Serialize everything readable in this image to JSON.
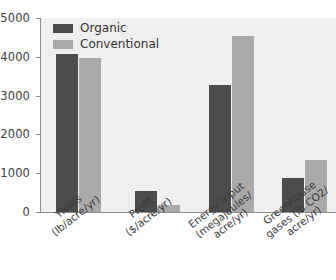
{
  "chart_data": {
    "type": "bar",
    "title": "",
    "subtitle": "",
    "xlabel": "",
    "ylabel": "",
    "ylim": [
      0,
      5000
    ],
    "yticks": [
      0,
      1000,
      2000,
      3000,
      4000,
      5000
    ],
    "ytick_labels": [
      "0",
      "1000",
      "2000",
      "3000",
      "4000",
      "5000"
    ],
    "grid": false,
    "legend_position": "top-left",
    "categories": [
      "Yields (lb/acre/yr)",
      "Profit ($/acre/yr)",
      "Energy input (megajoules/acre/yr)",
      "Greenhouse gases (lb CO2/acre/yr)"
    ],
    "category_lines": [
      [
        "Yields",
        "(lb/acre/yr)"
      ],
      [
        "Profit",
        "($/acre/yr)"
      ],
      [
        "Energy input",
        "(megajoules/",
        "acre/yr)"
      ],
      [
        "Greenhouse",
        "gases (lb CO2/",
        "acre/yr)"
      ]
    ],
    "series": [
      {
        "name": "Organic",
        "color": "#4c4c4c",
        "values": [
          4060,
          550,
          3270,
          870
        ]
      },
      {
        "name": "Conventional",
        "color": "#aaaaaa",
        "values": [
          3980,
          180,
          4530,
          1340
        ]
      }
    ]
  },
  "legend": {
    "items": [
      {
        "label": "Organic",
        "color": "#4c4c4c"
      },
      {
        "label": "Conventional",
        "color": "#aaaaaa"
      }
    ]
  },
  "style": {
    "plot_background": "#efefef",
    "page_background": "#ffffff",
    "axis_color": "#8d8d8d",
    "text_color": "#3b3b3b"
  }
}
